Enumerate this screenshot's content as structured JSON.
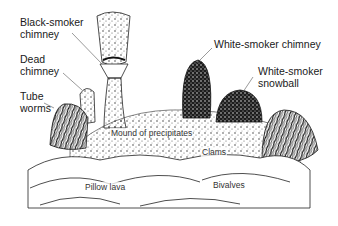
{
  "figure": {
    "labels": {
      "black_smoker": "Black-smoker\nchimney",
      "dead_chimney": "Dead\nchimney",
      "tube_worms": "Tube\nworms",
      "white_smoker_chimney": "White-smoker chimney",
      "white_smoker_snowball": "White-smoker\nsnowball",
      "mound": "Mound of precipitates",
      "clams": "Clams",
      "pillow_lava": "Pillow lava",
      "bivalves": "Bivalves"
    },
    "colors": {
      "ink": "#1a1a1a",
      "paper": "#ffffff"
    }
  }
}
